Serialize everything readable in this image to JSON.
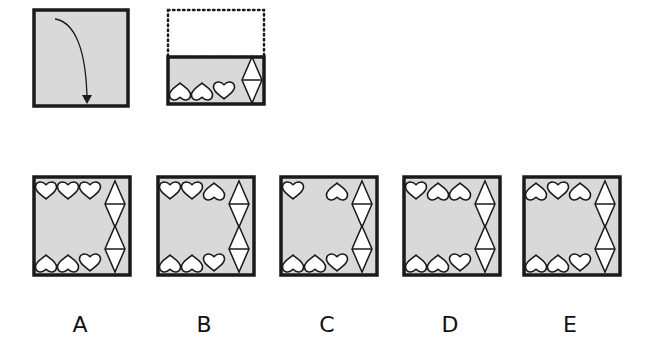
{
  "puzzle": {
    "type": "paper-folding",
    "reference": {
      "fold_panel": {
        "name": "fold-instruction",
        "arrow": "fold-down-arrow",
        "fill": "#d9d9d9"
      },
      "folded_panel": {
        "name": "folded-result",
        "visible_half": "bottom",
        "bottom_hearts": [
          "inverted",
          "inverted",
          "upright"
        ],
        "right_diamonds": 1
      }
    },
    "options": [
      {
        "label": "A",
        "top_hearts": [
          "upright",
          "upright",
          "upright"
        ],
        "bottom_hearts": [
          "inverted",
          "inverted",
          "upright"
        ],
        "right_diamonds": 2
      },
      {
        "label": "B",
        "top_hearts": [
          "upright",
          "upright",
          "inverted"
        ],
        "bottom_hearts": [
          "inverted",
          "inverted",
          "upright"
        ],
        "right_diamonds": 2
      },
      {
        "label": "C",
        "top_hearts": [
          "upright",
          null,
          "inverted"
        ],
        "bottom_hearts": [
          "inverted",
          "inverted",
          "upright"
        ],
        "right_diamonds": 2
      },
      {
        "label": "D",
        "top_hearts": [
          "upright",
          "inverted",
          "inverted"
        ],
        "bottom_hearts": [
          "inverted",
          "inverted",
          "upright"
        ],
        "right_diamonds": 2
      },
      {
        "label": "E",
        "top_hearts": [
          "inverted",
          "upright",
          "inverted"
        ],
        "bottom_hearts": [
          "inverted",
          "inverted",
          "upright"
        ],
        "right_diamonds": 2
      }
    ],
    "colors": {
      "panel_fill": "#d9d9d9",
      "stroke": "#1a1a1a",
      "shape_fill": "#ffffff"
    }
  }
}
